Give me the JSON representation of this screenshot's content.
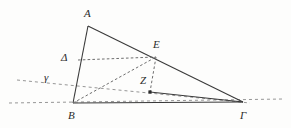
{
  "figure": {
    "kind": "euclidean-geometry-diagram",
    "width": 291,
    "height": 128,
    "background_color": "#fdfdfc",
    "stroke_color": "#3a3a3a",
    "dashed_color": "#6e6e6e",
    "label_color": "#2b2b2b"
  },
  "points": {
    "A": {
      "label": "A",
      "x": 88,
      "y": 26,
      "label_x": 84,
      "label_y": 8,
      "marked": false
    },
    "B": {
      "label": "B",
      "x": 73,
      "y": 103,
      "label_x": 68,
      "label_y": 110,
      "marked": false
    },
    "Gamma": {
      "label": "Γ",
      "x": 243,
      "y": 102,
      "label_x": 240,
      "label_y": 110,
      "marked": false
    },
    "Delta": {
      "label": "Δ",
      "x": 78,
      "y": 60,
      "label_x": 61,
      "label_y": 52,
      "marked": false
    },
    "E": {
      "label": "E",
      "x": 156,
      "y": 57,
      "label_x": 153,
      "label_y": 39,
      "marked": false
    },
    "Z": {
      "label": "Z",
      "x": 150,
      "y": 92,
      "label_x": 140,
      "label_y": 75,
      "marked": true
    },
    "gamma": {
      "label": "γ",
      "x": 48,
      "y": 84,
      "label_x": 44,
      "label_y": 72,
      "marked": false
    }
  },
  "segments": [
    {
      "name": "A-B",
      "style": "solid",
      "from": "A",
      "to": "B"
    },
    {
      "name": "A-Gamma",
      "style": "solid",
      "from": "A",
      "to": "Gamma"
    },
    {
      "name": "B-Gamma",
      "style": "solid",
      "from": "B",
      "to": "Gamma"
    },
    {
      "name": "Z-Gamma",
      "style": "solid",
      "from": "Z",
      "to": "Gamma"
    },
    {
      "name": "Delta-E",
      "style": "dashed",
      "from": "Delta",
      "to": "E"
    },
    {
      "name": "E-Z",
      "style": "dashed",
      "from": "E",
      "to": "Z"
    },
    {
      "name": "B-E",
      "style": "dashed",
      "from": "B",
      "to": "E"
    }
  ],
  "construction_lines": [
    {
      "name": "baseline-through-B-and-Gamma",
      "style": "dashed",
      "x1": 9,
      "y1": 103,
      "x2": 284,
      "y2": 99
    },
    {
      "name": "oblique-line-gamma",
      "style": "dashed",
      "x1": 17,
      "y1": 80,
      "x2": 250,
      "y2": 103
    }
  ],
  "labels": {
    "vertex_A": "A",
    "vertex_B": "B",
    "vertex_Gamma": "Γ",
    "vertex_Delta": "Δ",
    "vertex_E": "E",
    "vertex_Z": "Z",
    "line_gamma": "γ"
  }
}
